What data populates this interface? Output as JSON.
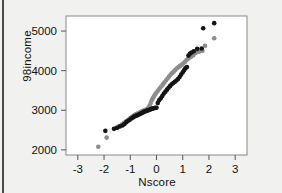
{
  "figure": {
    "background_color": "#f1f1ef",
    "plot_background": "#ffffff",
    "border_color": "#8a8a8a",
    "left_rule_color": "#4a4a4a"
  },
  "chart_data": {
    "type": "scatter",
    "title": "",
    "xlabel": "Nscore",
    "ylabel": "98income",
    "xlim": [
      -3.45,
      3.45
    ],
    "ylim": [
      1870,
      5380
    ],
    "xticks": [
      -3,
      -2,
      -1,
      0,
      1,
      2,
      3
    ],
    "xticklabels": [
      "-3",
      "-2",
      "-1",
      "0",
      "1",
      "2",
      "3"
    ],
    "yticks": [
      2000,
      3000,
      4000,
      5000
    ],
    "yticklabels": [
      "2000",
      "3000",
      "4000",
      "5000"
    ],
    "grid": false,
    "legend": "none",
    "series": [
      {
        "name": "black-series",
        "color": "#141414",
        "marker": "circle",
        "marker_size": 4.6,
        "points": [
          [
            -1.95,
            2480
          ],
          [
            -1.62,
            2530
          ],
          [
            -1.5,
            2560
          ],
          [
            -1.4,
            2590
          ],
          [
            -1.3,
            2615
          ],
          [
            -1.22,
            2650
          ],
          [
            -1.15,
            2700
          ],
          [
            -1.08,
            2735
          ],
          [
            -1.02,
            2760
          ],
          [
            -0.96,
            2790
          ],
          [
            -0.9,
            2815
          ],
          [
            -0.85,
            2840
          ],
          [
            -0.8,
            2855
          ],
          [
            -0.75,
            2870
          ],
          [
            -0.7,
            2885
          ],
          [
            -0.65,
            2900
          ],
          [
            -0.6,
            2915
          ],
          [
            -0.56,
            2930
          ],
          [
            -0.52,
            2945
          ],
          [
            -0.48,
            2960
          ],
          [
            -0.44,
            2970
          ],
          [
            -0.4,
            2980
          ],
          [
            -0.36,
            2990
          ],
          [
            -0.32,
            3000
          ],
          [
            -0.28,
            3010
          ],
          [
            -0.24,
            3020
          ],
          [
            -0.2,
            3030
          ],
          [
            -0.16,
            3040
          ],
          [
            -0.12,
            3048
          ],
          [
            -0.08,
            3055
          ],
          [
            -0.04,
            3060
          ],
          [
            0.0,
            3062
          ],
          [
            0.05,
            3180
          ],
          [
            0.1,
            3250
          ],
          [
            0.16,
            3300
          ],
          [
            0.22,
            3360
          ],
          [
            0.28,
            3420
          ],
          [
            0.34,
            3470
          ],
          [
            0.4,
            3520
          ],
          [
            0.46,
            3570
          ],
          [
            0.52,
            3615
          ],
          [
            0.58,
            3655
          ],
          [
            0.64,
            3690
          ],
          [
            0.7,
            3720
          ],
          [
            0.76,
            3750
          ],
          [
            0.82,
            3790
          ],
          [
            0.88,
            3840
          ],
          [
            0.94,
            3900
          ],
          [
            1.0,
            3960
          ],
          [
            1.05,
            4010
          ],
          [
            1.1,
            4060
          ],
          [
            1.16,
            4090
          ],
          [
            1.22,
            4380
          ],
          [
            1.28,
            4430
          ],
          [
            1.34,
            4460
          ],
          [
            1.42,
            4490
          ],
          [
            1.55,
            4550
          ],
          [
            1.72,
            4560
          ],
          [
            1.78,
            5070
          ],
          [
            2.2,
            5200
          ]
        ]
      },
      {
        "name": "gray-series",
        "color": "#8c8c8c",
        "marker": "circle",
        "marker_size": 4.6,
        "points": [
          [
            -2.22,
            2080
          ],
          [
            -1.9,
            2310
          ],
          [
            -1.52,
            2560
          ],
          [
            -1.42,
            2600
          ],
          [
            -1.32,
            2640
          ],
          [
            -1.24,
            2680
          ],
          [
            -1.16,
            2720
          ],
          [
            -1.08,
            2760
          ],
          [
            -1.0,
            2800
          ],
          [
            -0.94,
            2830
          ],
          [
            -0.88,
            2860
          ],
          [
            -0.82,
            2885
          ],
          [
            -0.76,
            2905
          ],
          [
            -0.7,
            2925
          ],
          [
            -0.64,
            2945
          ],
          [
            -0.58,
            2965
          ],
          [
            -0.52,
            2985
          ],
          [
            -0.46,
            3000
          ],
          [
            -0.4,
            3020
          ],
          [
            -0.34,
            3040
          ],
          [
            -0.3,
            3070
          ],
          [
            -0.26,
            3120
          ],
          [
            -0.22,
            3180
          ],
          [
            -0.18,
            3250
          ],
          [
            -0.14,
            3300
          ],
          [
            -0.1,
            3350
          ],
          [
            -0.05,
            3400
          ],
          [
            0.0,
            3450
          ],
          [
            0.06,
            3500
          ],
          [
            0.12,
            3550
          ],
          [
            0.18,
            3600
          ],
          [
            0.24,
            3650
          ],
          [
            0.3,
            3700
          ],
          [
            0.36,
            3750
          ],
          [
            0.42,
            3800
          ],
          [
            0.48,
            3850
          ],
          [
            0.54,
            3900
          ],
          [
            0.6,
            3940
          ],
          [
            0.66,
            3980
          ],
          [
            0.72,
            4020
          ],
          [
            0.78,
            4060
          ],
          [
            0.84,
            4090
          ],
          [
            0.9,
            4120
          ],
          [
            0.96,
            4150
          ],
          [
            1.02,
            4180
          ],
          [
            1.08,
            4220
          ],
          [
            1.14,
            4260
          ],
          [
            1.2,
            4300
          ],
          [
            1.26,
            4330
          ],
          [
            1.32,
            4350
          ],
          [
            1.4,
            4390
          ],
          [
            1.5,
            4450
          ],
          [
            1.62,
            4480
          ],
          [
            1.75,
            4500
          ],
          [
            1.85,
            4630
          ],
          [
            2.2,
            4820
          ]
        ]
      }
    ]
  }
}
